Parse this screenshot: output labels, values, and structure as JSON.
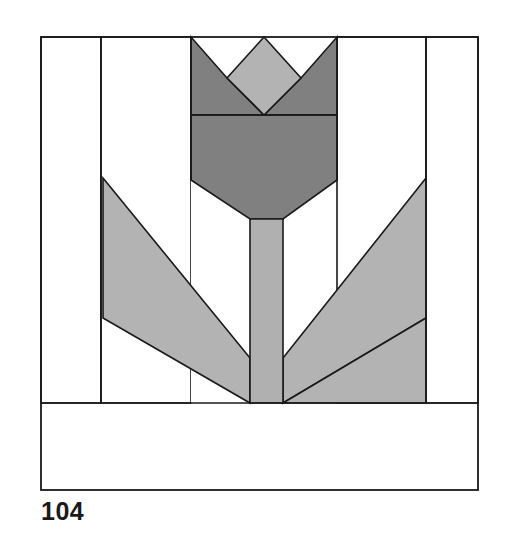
{
  "page": {
    "background_color": "#ffffff",
    "width": 509,
    "height": 537
  },
  "block_number": {
    "label": "104"
  },
  "palette": {
    "outline": "#1a1a1a",
    "background_fabric": "#ffffff",
    "flower_dark": "#808080",
    "flower_medium": "#999999",
    "leaf_gray": "#b3b3b3",
    "stem_gray": "#b0b0b0",
    "ground_light": "#e3e3e3",
    "page_white": "#ffffff"
  },
  "block": {
    "name": "Tulip / Flower Pot patchwork block",
    "bounds": {
      "x": 41,
      "y": 37,
      "width": 437,
      "height": 453
    },
    "stroke_width": 1.6
  },
  "pieces": [
    {
      "id": "background-left-outer",
      "name": "background-left-outer-strip",
      "fabric": "background_fabric",
      "points": "41,37 101,37 101,403 41,403"
    },
    {
      "id": "background-right-outer",
      "name": "background-right-outer-strip",
      "fabric": "background_fabric",
      "points": "426,37 478,37 478,403 426,403"
    },
    {
      "id": "background-center-left",
      "name": "background-center-left",
      "fabric": "background_fabric",
      "points": "101,37 191,37 191,403 101,403"
    },
    {
      "id": "background-center-right",
      "name": "background-center-right",
      "fabric": "background_fabric",
      "points": "337,37 426,37 426,403 337,403"
    },
    {
      "id": "background-center-mid",
      "name": "background-center-middle",
      "fabric": "background_fabric",
      "points": "191,37 337,37 337,403 191,403"
    },
    {
      "id": "petal-left",
      "name": "petal-left-triangle",
      "fabric": "flower_dark",
      "points": "191,37 191,115 264,115 227,78"
    },
    {
      "id": "petal-right",
      "name": "petal-right-triangle",
      "fabric": "flower_dark",
      "points": "337,37 337,115 264,115 301,78"
    },
    {
      "id": "petal-center-diamond",
      "name": "petal-center-diamond",
      "fabric": "leaf_gray",
      "points": "264,37 301,78 264,115 227,78"
    },
    {
      "id": "flower-body",
      "name": "flower-body-bowl",
      "fabric": "flower_dark",
      "points": "191,115 337,115 337,180 283,219 250,219 191,180"
    },
    {
      "id": "stem",
      "name": "flower-stem",
      "fabric": "stem_gray",
      "points": "250,219 283,219 283,403 250,403"
    },
    {
      "id": "leaf-left",
      "name": "leaf-left-parallelogram",
      "fabric": "leaf_gray",
      "points": "103,178 250,358 250,403 103,318"
    },
    {
      "id": "leaf-left-lower",
      "name": "leaf-left-lower-wedge",
      "fabric": "leaf_gray",
      "points": "103,318 250,403 103,403"
    },
    {
      "id": "leaf-right",
      "name": "leaf-right-parallelogram",
      "fabric": "leaf_gray",
      "points": "426,178 283,358 283,403 426,318"
    },
    {
      "id": "leaf-right-lower",
      "name": "leaf-right-lower-wedge",
      "fabric": "leaf_gray",
      "points": "426,318 283,403 426,403"
    },
    {
      "id": "ground-bar",
      "name": "ground-base-strip",
      "fabric": "ground_light",
      "points": "41,403 478,403 478,490 41,490"
    }
  ],
  "seam_lines": [
    {
      "id": "seam-vertical-left",
      "name": "seam-line-vertical-left",
      "x1": 101,
      "y1": 37,
      "x2": 101,
      "y2": 403
    },
    {
      "id": "seam-vertical-right",
      "name": "seam-line-vertical-right",
      "x1": 426,
      "y1": 37,
      "x2": 426,
      "y2": 403
    },
    {
      "id": "seam-vertical-head-left",
      "name": "seam-line-head-left",
      "x1": 191,
      "y1": 37,
      "x2": 191,
      "y2": 180
    },
    {
      "id": "seam-vertical-head-right",
      "name": "seam-line-head-right",
      "x1": 337,
      "y1": 37,
      "x2": 337,
      "y2": 180
    },
    {
      "id": "seam-horizontal-petals",
      "name": "seam-line-petal-base",
      "x1": 191,
      "y1": 115,
      "x2": 337,
      "y2": 115
    },
    {
      "id": "seam-horizontal-ground",
      "name": "seam-line-ground-top",
      "x1": 41,
      "y1": 403,
      "x2": 478,
      "y2": 403
    }
  ]
}
